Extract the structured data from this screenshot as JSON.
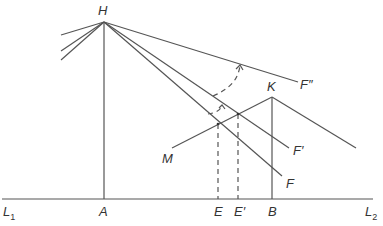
{
  "diagram": {
    "labels": {
      "H": "H",
      "K": "K",
      "M": "M",
      "F_double_prime": "F″",
      "F_prime": "F′",
      "F": "F",
      "L1_main": "L",
      "L1_sub": "1",
      "L2_main": "L",
      "L2_sub": "2",
      "A": "A",
      "E": "E",
      "E_prime": "E′",
      "B": "B"
    },
    "colors": {
      "line": "#555555",
      "text": "#333333",
      "background": "#ffffff"
    }
  }
}
